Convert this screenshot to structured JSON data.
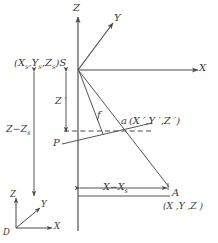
{
  "figure": {
    "type": "technical-diagram",
    "stroke_color": "#4a4a4a",
    "text_color": "#3a3a3a",
    "background": "#ffffff"
  },
  "axes": {
    "main": {
      "z_label": "Z",
      "y_label": "Y",
      "x_label": "X"
    },
    "origin_triad": {
      "origin_label": "D",
      "z_label": "Z",
      "y_label": "Y",
      "x_label": "X"
    }
  },
  "points": {
    "station": {
      "name": "S",
      "coords_label": "(X",
      "coords_sub1": "s",
      "coords_mid": ",Y",
      "coords_sub2": "s",
      "coords_mid2": ",Z",
      "coords_sub3": "s",
      "coords_close": ")",
      "full_label": "(Xs ,Ys ,Zs )S"
    },
    "image_point": {
      "name": "a",
      "coords": "(X ′,Y ′,Z ′)",
      "x_prime": "X ′",
      "y_prime": "Y ′",
      "z_prime": "Z ′"
    },
    "principal_point": {
      "name": "P"
    },
    "ground_point": {
      "name": "A",
      "coords": "(X ,Y ,Z )"
    }
  },
  "measurements": {
    "focal": {
      "label": "f"
    },
    "vertical_outer": {
      "label": "Z−Z",
      "sub": "s"
    },
    "vertical_inner": {
      "label": "Z ′"
    },
    "horizontal": {
      "label": "X−X",
      "sub": "s"
    }
  }
}
